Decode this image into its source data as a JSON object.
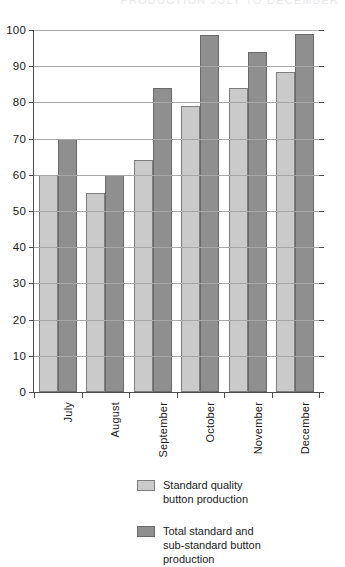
{
  "top_clipped_text": "PRODUCTION JULY TO DECEMBER",
  "chart_data": {
    "type": "bar",
    "title": "",
    "subtitle": "",
    "xlabel": "",
    "ylabel": "",
    "categories": [
      "July",
      "August",
      "September",
      "October",
      "November",
      "December"
    ],
    "series": [
      {
        "name": "Standard quality button production",
        "color": "#cacaca",
        "values": [
          60,
          55,
          64,
          79,
          84,
          88.5
        ]
      },
      {
        "name": "Total standard and sub-standard button production",
        "color": "#8f8f8f",
        "values": [
          70,
          60,
          84,
          98.5,
          94,
          99
        ]
      }
    ],
    "ylim": [
      0,
      100
    ],
    "ytick_step": 10,
    "yticks": [
      0,
      10,
      20,
      30,
      40,
      50,
      60,
      70,
      80,
      90,
      100
    ],
    "ytick_labels": [
      "0",
      "10",
      "20",
      "30",
      "40",
      "50",
      "60",
      "70",
      "80",
      "90",
      "100"
    ],
    "grid": true,
    "grid_axis": "y",
    "legend_position": "bottom-center",
    "legend": [
      "Standard quality button production",
      "Total standard and sub-standard button production"
    ]
  },
  "legend": {
    "items": [
      {
        "swatch": "light",
        "line1": "Standard quality",
        "line2": "button production",
        "line3": ""
      },
      {
        "swatch": "dark",
        "line1": "Total standard and",
        "line2": "sub-standard button",
        "line3": "production"
      }
    ]
  },
  "colors": {
    "series_light": "#cacaca",
    "series_dark": "#8f8f8f",
    "axis": "#4d4d4d",
    "grid": "#a8a8a8",
    "background": "#ffffff"
  }
}
